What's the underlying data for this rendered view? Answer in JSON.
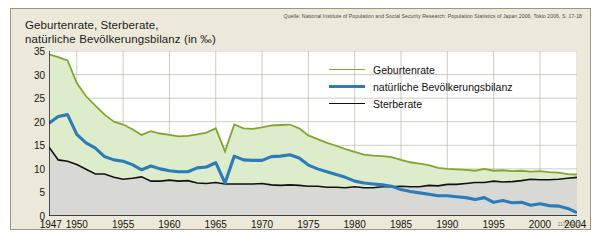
{
  "title": "Geburtenrate, Sterberate,\nnatürliche Bevölkerungsbilanz (in ‰)",
  "source": "Quelle: National Institute of Population and Social Security Research: Population Statistics of Japan 2006, Tokio 2006, S. 17-18",
  "code": "11710E_1",
  "colors": {
    "birth": "#7fa832",
    "balance": "#2b7cb8",
    "death": "#111111",
    "birth_fill": "#ddeccb",
    "death_fill": "#d8d8d4",
    "background": "#ece9da",
    "grid": "#b9b6a6"
  },
  "legend": [
    {
      "label": "Geburtenrate",
      "color": "#7fa832"
    },
    {
      "label": "natürliche Bevölkerungsbilanz",
      "color": "#2b7cb8"
    },
    {
      "label": "Sterberate",
      "color": "#111111"
    }
  ],
  "chart_data": {
    "type": "line",
    "title": "Geburtenrate, Sterberate, natürliche Bevölkerungsbilanz (in ‰)",
    "xlabel": "",
    "ylabel": "",
    "xlim": [
      1947,
      2004
    ],
    "ylim": [
      0,
      35
    ],
    "yticks": [
      0,
      5,
      10,
      15,
      20,
      25,
      30,
      35
    ],
    "xticks": [
      1947,
      1950,
      1955,
      1960,
      1965,
      1970,
      1975,
      1980,
      1985,
      1990,
      1995,
      2000,
      2004
    ],
    "xtick_labels": [
      "1947",
      "1950",
      "1955",
      "1960",
      "1965",
      "1970",
      "1975",
      "1980",
      "1985",
      "1990",
      "1995",
      "2000",
      "2004"
    ],
    "grid": true,
    "legend_position": "upper-right-inside",
    "x": [
      1947,
      1948,
      1949,
      1950,
      1951,
      1952,
      1953,
      1954,
      1955,
      1956,
      1957,
      1958,
      1959,
      1960,
      1961,
      1962,
      1963,
      1964,
      1965,
      1966,
      1967,
      1968,
      1969,
      1970,
      1971,
      1972,
      1973,
      1974,
      1975,
      1976,
      1977,
      1978,
      1979,
      1980,
      1981,
      1982,
      1983,
      1984,
      1985,
      1986,
      1987,
      1988,
      1989,
      1990,
      1991,
      1992,
      1993,
      1994,
      1995,
      1996,
      1997,
      1998,
      1999,
      2000,
      2001,
      2002,
      2003,
      2004
    ],
    "series": [
      {
        "name": "Geburtenrate",
        "color": "#7fa832",
        "values": [
          34.3,
          33.7,
          33.0,
          28.2,
          25.4,
          23.4,
          21.5,
          20.0,
          19.4,
          18.4,
          17.2,
          18.0,
          17.5,
          17.2,
          16.9,
          17.0,
          17.3,
          17.7,
          18.6,
          13.7,
          19.4,
          18.6,
          18.5,
          18.8,
          19.2,
          19.3,
          19.4,
          18.6,
          17.1,
          16.3,
          15.5,
          14.9,
          14.2,
          13.6,
          13.0,
          12.8,
          12.7,
          12.5,
          11.9,
          11.4,
          11.1,
          10.8,
          10.2,
          10.0,
          9.9,
          9.8,
          9.6,
          10.0,
          9.6,
          9.7,
          9.5,
          9.6,
          9.4,
          9.5,
          9.3,
          9.2,
          8.9,
          8.8
        ]
      },
      {
        "name": "natürliche Bevölkerungsbilanz",
        "color": "#2b7cb8",
        "values": [
          19.7,
          21.1,
          21.5,
          17.3,
          15.5,
          14.4,
          12.6,
          11.9,
          11.6,
          10.9,
          9.8,
          10.6,
          10.0,
          9.6,
          9.4,
          9.4,
          10.2,
          10.4,
          11.3,
          7.0,
          12.7,
          11.9,
          11.8,
          11.8,
          12.6,
          12.7,
          13.0,
          12.3,
          10.8,
          10.0,
          9.4,
          8.8,
          8.2,
          7.4,
          7.0,
          6.8,
          6.6,
          6.3,
          5.6,
          5.2,
          4.9,
          4.6,
          4.3,
          4.3,
          4.1,
          3.9,
          3.5,
          3.9,
          2.9,
          3.3,
          2.8,
          2.9,
          2.3,
          2.6,
          2.2,
          2.1,
          1.6,
          0.7
        ]
      },
      {
        "name": "Sterberate",
        "color": "#111111",
        "values": [
          14.6,
          11.9,
          11.6,
          10.9,
          9.9,
          8.9,
          8.9,
          8.2,
          7.8,
          8.0,
          8.3,
          7.4,
          7.4,
          7.6,
          7.4,
          7.5,
          7.0,
          6.9,
          7.1,
          6.8,
          6.8,
          6.8,
          6.8,
          6.9,
          6.6,
          6.5,
          6.6,
          6.5,
          6.3,
          6.3,
          6.1,
          6.1,
          6.0,
          6.2,
          6.0,
          6.0,
          6.2,
          6.2,
          6.3,
          6.2,
          6.2,
          6.5,
          6.4,
          6.7,
          6.7,
          6.9,
          7.1,
          7.1,
          7.4,
          7.2,
          7.3,
          7.5,
          7.8,
          7.7,
          7.7,
          7.8,
          8.0,
          8.2
        ]
      }
    ]
  }
}
